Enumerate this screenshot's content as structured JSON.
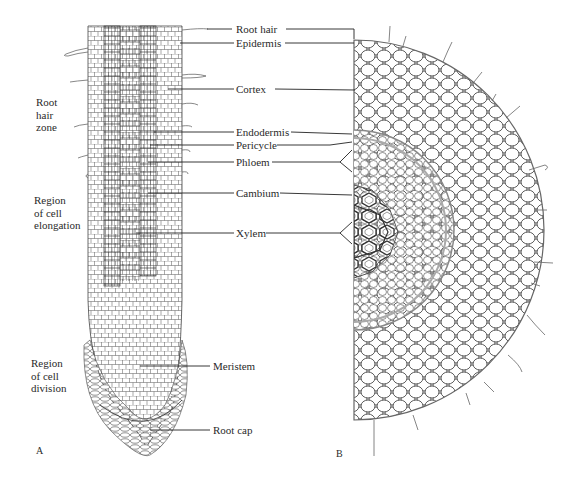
{
  "figure": {
    "panels": [
      {
        "id": "A",
        "label": "A",
        "description": "Longitudinal section of root tip"
      },
      {
        "id": "B",
        "label": "B",
        "description": "Cross section of root"
      }
    ],
    "zones": [
      {
        "id": "root-hair-zone",
        "text": "Root\nhair\nzone"
      },
      {
        "id": "region-of-cell-elongation",
        "text": "Region\nof cell\nelongation"
      },
      {
        "id": "region-of-cell-division",
        "text": "Region\nof cell\ndivision"
      }
    ],
    "labels": [
      {
        "id": "root-hair",
        "text": "Root hair"
      },
      {
        "id": "epidermis",
        "text": "Epidermis"
      },
      {
        "id": "cortex",
        "text": "Cortex"
      },
      {
        "id": "endodermis",
        "text": "Endodermis"
      },
      {
        "id": "pericycle",
        "text": "Pericycle"
      },
      {
        "id": "phloem",
        "text": "Phloem"
      },
      {
        "id": "cambium",
        "text": "Cambium"
      },
      {
        "id": "xylem",
        "text": "Xylem"
      },
      {
        "id": "meristem",
        "text": "Meristem"
      },
      {
        "id": "root-cap",
        "text": "Root cap"
      }
    ]
  }
}
